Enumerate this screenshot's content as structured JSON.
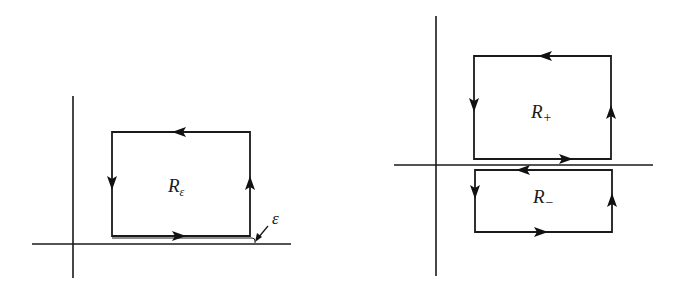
{
  "figure": {
    "left_panel": {
      "region_label": "R",
      "region_subscript": "ε",
      "epsilon_label": "ε",
      "contour_direction": "counterclockwise"
    },
    "right_panel": {
      "upper_region_label": "R",
      "upper_region_subscript": "+",
      "lower_region_label": "R",
      "lower_region_subscript": "−",
      "contour_direction": "counterclockwise"
    },
    "colors": {
      "line": "#1a1a1a",
      "background": "#ffffff"
    }
  }
}
